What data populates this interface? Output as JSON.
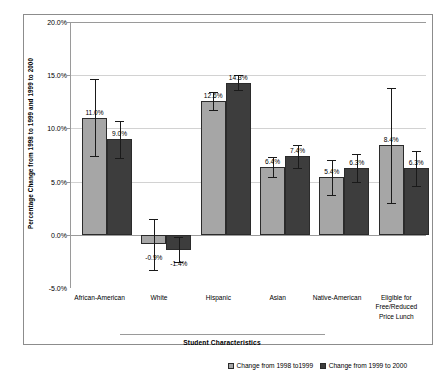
{
  "chart_data": {
    "type": "bar",
    "title": "",
    "xlabel": "Student Characteristics",
    "ylabel": "Percentage Change from 1998 to 1999 and 1999 to 2000",
    "ylim": [
      -5.0,
      20.0
    ],
    "ytick_step": 5.0,
    "grid": true,
    "legend_position": "bottom-right",
    "categories": [
      "African-American",
      "White",
      "Hispanic",
      "Asian",
      "Native-American",
      "Eligible for\nFree/Reduced\nPrice Lunch"
    ],
    "ytick_labels": [
      "20.0%",
      "15.0%",
      "10.0%",
      "5.0%",
      "0.0%",
      "-5.0%"
    ],
    "ytick_values": [
      20.0,
      15.0,
      10.0,
      5.0,
      0.0,
      -5.0
    ],
    "series": [
      {
        "name": "Change from 1998 to1999",
        "color": "#a6a6a6",
        "values": [
          11.0,
          -0.9,
          12.6,
          6.4,
          5.4,
          8.4
        ],
        "labels": [
          "11.0%",
          "-0.9%",
          "12.6%",
          "6.4%",
          "5.4%",
          "8.4%"
        ],
        "err_low": [
          7.4,
          -3.3,
          11.7,
          5.4,
          3.7,
          3.0
        ],
        "err_high": [
          14.6,
          1.5,
          13.4,
          7.3,
          7.0,
          13.8
        ]
      },
      {
        "name": "Change from 1999 to 2000",
        "color": "#3d3d3d",
        "values": [
          9.0,
          -1.4,
          14.3,
          7.4,
          6.3,
          6.3
        ],
        "labels": [
          "9.0%",
          "-1.4%",
          "14.3%",
          "7.4%",
          "6.3%",
          "6.3%"
        ],
        "err_low": [
          7.2,
          -2.6,
          13.6,
          6.3,
          5.0,
          4.6
        ],
        "err_high": [
          10.7,
          -0.2,
          15.0,
          8.4,
          7.6,
          7.9
        ]
      }
    ]
  },
  "legend": {
    "items": [
      {
        "label": "Change from 1998 to1999"
      },
      {
        "label": "Change from 1999 to 2000"
      }
    ]
  }
}
